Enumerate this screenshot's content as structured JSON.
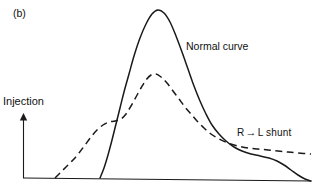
{
  "figure": {
    "panel_letter": "(b)",
    "y_axis_title": "Injection",
    "background_color": "#ffffff",
    "line_color": "#1a1a1a"
  },
  "annotations": {
    "normal_curve_label": "Normal curve",
    "shunt_label_left": "R",
    "shunt_label_arrow": "→",
    "shunt_label_right": "L shunt"
  },
  "chart_data": {
    "type": "line",
    "title": "",
    "subtitle": "",
    "xlabel": "",
    "ylabel": "Injection",
    "grid": false,
    "legend_position": "inline-annotation",
    "axis": {
      "x_axis_y": 178,
      "x_axis_from_x": 23,
      "x_axis_to_x": 311,
      "y_axis_x": 23,
      "y_axis_top_y": 118,
      "y_axis_bottom_y": 178,
      "injection_marker_x": 23,
      "injection_marker_y": 118
    },
    "xlim": [
      0,
      320
    ],
    "ylim": [
      0,
      194
    ],
    "series": [
      {
        "name": "Normal curve",
        "style": "solid",
        "label": "Normal curve",
        "points": [
          [
            100,
            178
          ],
          [
            104,
            168
          ],
          [
            108,
            155
          ],
          [
            112,
            140
          ],
          [
            116,
            124
          ],
          [
            120,
            108
          ],
          [
            124,
            92
          ],
          [
            129,
            74
          ],
          [
            134,
            56
          ],
          [
            140,
            38
          ],
          [
            146,
            24
          ],
          [
            152,
            14
          ],
          [
            158,
            10
          ],
          [
            164,
            13
          ],
          [
            170,
            22
          ],
          [
            176,
            36
          ],
          [
            182,
            52
          ],
          [
            188,
            69
          ],
          [
            194,
            86
          ],
          [
            200,
            101
          ],
          [
            206,
            114
          ],
          [
            212,
            125
          ],
          [
            219,
            134
          ],
          [
            226,
            141
          ],
          [
            234,
            147
          ],
          [
            242,
            151
          ],
          [
            251,
            154
          ],
          [
            260,
            156
          ],
          [
            269,
            158
          ],
          [
            277,
            161
          ],
          [
            284,
            165
          ],
          [
            291,
            170
          ],
          [
            298,
            175
          ],
          [
            305,
            179
          ],
          [
            311,
            181
          ]
        ]
      },
      {
        "name": "R → L shunt",
        "style": "dashed",
        "label": "R → L shunt",
        "points": [
          [
            55,
            178
          ],
          [
            61,
            172
          ],
          [
            67,
            166
          ],
          [
            73,
            160
          ],
          [
            79,
            153
          ],
          [
            85,
            145
          ],
          [
            91,
            137
          ],
          [
            97,
            130
          ],
          [
            103,
            125
          ],
          [
            109,
            122
          ],
          [
            115,
            121
          ],
          [
            121,
            119
          ],
          [
            126,
            114
          ],
          [
            131,
            106
          ],
          [
            136,
            97
          ],
          [
            141,
            88
          ],
          [
            146,
            80
          ],
          [
            151,
            75
          ],
          [
            156,
            74
          ],
          [
            161,
            77
          ],
          [
            167,
            83
          ],
          [
            173,
            91
          ],
          [
            179,
            99
          ],
          [
            185,
            107
          ],
          [
            191,
            114
          ],
          [
            197,
            121
          ],
          [
            204,
            128
          ],
          [
            211,
            134
          ],
          [
            219,
            139
          ],
          [
            228,
            143
          ],
          [
            238,
            146
          ],
          [
            248,
            148
          ],
          [
            258,
            149
          ],
          [
            268,
            150
          ],
          [
            278,
            151
          ],
          [
            288,
            152
          ],
          [
            298,
            153
          ],
          [
            311,
            154
          ]
        ]
      }
    ]
  }
}
